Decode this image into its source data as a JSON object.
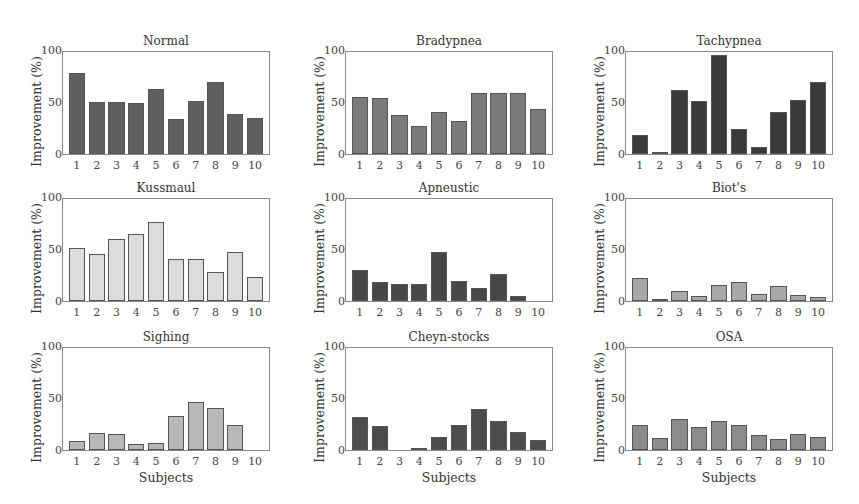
{
  "figure": {
    "ylabel": "Improvement (%)",
    "xlabel": "Subjects",
    "yticks": [
      "0",
      "50",
      "100"
    ],
    "xticks": [
      "1",
      "2",
      "3",
      "4",
      "5",
      "6",
      "7",
      "8",
      "9",
      "10"
    ]
  },
  "chart_data": [
    {
      "type": "bar",
      "title": "Normal",
      "color": "#606060",
      "xlabel": "",
      "ylabel": "Improvement (%)",
      "ylim": [
        0,
        100
      ],
      "categories": [
        "1",
        "2",
        "3",
        "4",
        "5",
        "6",
        "7",
        "8",
        "9",
        "10"
      ],
      "values": [
        79,
        51,
        51,
        50,
        64,
        34,
        52,
        71,
        39,
        35
      ]
    },
    {
      "type": "bar",
      "title": "Bradypnea",
      "color": "#7a7a7a",
      "xlabel": "",
      "ylabel": "Improvement (%)",
      "ylim": [
        0,
        100
      ],
      "categories": [
        "1",
        "2",
        "3",
        "4",
        "5",
        "6",
        "7",
        "8",
        "9",
        "10"
      ],
      "values": [
        56,
        55,
        38,
        27,
        41,
        32,
        60,
        60,
        60,
        44
      ]
    },
    {
      "type": "bar",
      "title": "Tachypnea",
      "color": "#3a3a3a",
      "xlabel": "",
      "ylabel": "Improvement (%)",
      "ylim": [
        0,
        100
      ],
      "categories": [
        "1",
        "2",
        "3",
        "4",
        "5",
        "6",
        "7",
        "8",
        "9",
        "10"
      ],
      "values": [
        19,
        2,
        63,
        52,
        97,
        25,
        7,
        41,
        53,
        71
      ]
    },
    {
      "type": "bar",
      "title": "Kussmaul",
      "color": "#dcdcdc",
      "xlabel": "",
      "ylabel": "Improvement (%)",
      "ylim": [
        0,
        100
      ],
      "categories": [
        "1",
        "2",
        "3",
        "4",
        "5",
        "6",
        "7",
        "8",
        "9",
        "10"
      ],
      "values": [
        52,
        46,
        61,
        66,
        77,
        41,
        41,
        28,
        48,
        24
      ]
    },
    {
      "type": "bar",
      "title": "Apneustic",
      "color": "#474747",
      "xlabel": "",
      "ylabel": "Improvement (%)",
      "ylim": [
        0,
        100
      ],
      "categories": [
        "1",
        "2",
        "3",
        "4",
        "5",
        "6",
        "7",
        "8",
        "9",
        "10"
      ],
      "values": [
        30,
        19,
        17,
        17,
        48,
        20,
        13,
        26,
        5,
        0
      ]
    },
    {
      "type": "bar",
      "title": "Biot's",
      "color": "#a8a8a8",
      "xlabel": "",
      "ylabel": "Improvement (%)",
      "ylim": [
        0,
        100
      ],
      "categories": [
        "1",
        "2",
        "3",
        "4",
        "5",
        "6",
        "7",
        "8",
        "9",
        "10"
      ],
      "values": [
        23,
        2,
        10,
        5,
        16,
        19,
        7,
        15,
        6,
        4
      ]
    },
    {
      "type": "bar",
      "title": "Sighing",
      "color": "#b8b8b8",
      "xlabel": "Subjects",
      "ylabel": "Improvement (%)",
      "ylim": [
        0,
        100
      ],
      "categories": [
        "1",
        "2",
        "3",
        "4",
        "5",
        "6",
        "7",
        "8",
        "9",
        "10"
      ],
      "values": [
        9,
        17,
        16,
        6,
        7,
        33,
        47,
        41,
        25,
        0
      ]
    },
    {
      "type": "bar",
      "title": "Cheyn-stocks",
      "color": "#4c4c4c",
      "xlabel": "Subjects",
      "ylabel": "Improvement (%)",
      "ylim": [
        0,
        100
      ],
      "categories": [
        "1",
        "2",
        "3",
        "4",
        "5",
        "6",
        "7",
        "8",
        "9",
        "10"
      ],
      "values": [
        32,
        24,
        0,
        2,
        13,
        25,
        40,
        28,
        18,
        10
      ]
    },
    {
      "type": "bar",
      "title": "OSA",
      "color": "#8c8c8c",
      "xlabel": "Subjects",
      "ylabel": "Improvement (%)",
      "ylim": [
        0,
        100
      ],
      "categories": [
        "1",
        "2",
        "3",
        "4",
        "5",
        "6",
        "7",
        "8",
        "9",
        "10"
      ],
      "values": [
        25,
        12,
        30,
        23,
        28,
        25,
        15,
        11,
        16,
        13
      ]
    }
  ]
}
